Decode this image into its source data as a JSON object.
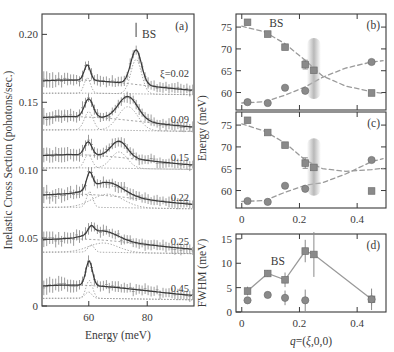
{
  "figure": {
    "background": "#ffffff",
    "ink_color": "#3a3a3a",
    "marker_color": "#8a8a8a",
    "line_color": "#9a9a9a",
    "band_color": "#b5b5b5"
  },
  "panel_a": {
    "label": "(a)",
    "xlabel": "Energy (meV)",
    "ylabel": "Inelastic Cross Section (pohotons/sec.)",
    "xticks": [
      60,
      80
    ],
    "xtick_labels": [
      "60",
      "80"
    ],
    "yticks": [
      0,
      0.05,
      0.1,
      0.15,
      0.2
    ],
    "ytick_labels": [
      "0",
      "0.05",
      "0.10",
      "0.15",
      "0.20"
    ],
    "xlim": [
      44,
      96
    ],
    "ylim": [
      0,
      0.215
    ],
    "bs_label": "BS",
    "curve_labels": [
      "ξ=0.02",
      "0.09",
      "0.15",
      "0.22",
      "0.25",
      "0.45"
    ],
    "curve_xi": [
      0.02,
      0.09,
      0.15,
      0.22,
      0.25,
      0.45
    ],
    "offsets": [
      0.155,
      0.128,
      0.1,
      0.071,
      0.038,
      0.004
    ],
    "peak1_center": [
      59.5,
      60.0,
      59.8,
      60.3,
      60.8,
      60.2
    ],
    "peak1_height": [
      0.0115,
      0.0135,
      0.0098,
      0.0118,
      0.0055,
      0.0135
    ],
    "peak1_fwhm": [
      2.5,
      3.5,
      3.0,
      2.4,
      2.4,
      2.6
    ],
    "peak2_center": [
      76.2,
      73.4,
      70.4,
      66.5,
      65.0,
      59.9
    ],
    "peak2_height": [
      0.0255,
      0.0175,
      0.012,
      0.0098,
      0.0068,
      0.0048
    ],
    "peak2_fwhm": [
      4.3,
      7.9,
      6.6,
      12.5,
      11.8,
      2.6
    ]
  },
  "panel_b": {
    "label": "(b)",
    "ylabel_shared": "Energy (meV)",
    "yticks": [
      60,
      65,
      70,
      75
    ],
    "ytick_labels": [
      "60",
      "65",
      "70",
      "75"
    ],
    "xticks": [
      0,
      0.2,
      0.4
    ],
    "ylim": [
      56,
      78
    ],
    "xlim": [
      -0.02,
      0.5
    ],
    "bs_label": "BS",
    "band_center_x": 0.25,
    "series": [
      {
        "name": "upper-branch-squares",
        "marker": "square",
        "x": [
          0.02,
          0.09,
          0.15,
          0.22,
          0.25,
          0.45
        ],
        "y": [
          76.1,
          73.4,
          70.4,
          66.4,
          65.1,
          59.9
        ],
        "yerr": [
          0.0,
          0.0,
          0.0,
          1.0,
          0.0,
          0.0
        ]
      },
      {
        "name": "lower-branch-circles",
        "marker": "circle",
        "x": [
          0.02,
          0.09,
          0.15,
          0.22,
          0.45
        ],
        "y": [
          57.8,
          57.6,
          61.1,
          60.4,
          67.0
        ],
        "yerr": [
          0.0,
          0.0,
          0.0,
          0.0,
          0.0
        ]
      }
    ],
    "dashed_curve_1": [
      [
        0.0,
        75.2
      ],
      [
        0.08,
        73.9
      ],
      [
        0.15,
        71.2
      ],
      [
        0.22,
        67.4
      ],
      [
        0.28,
        63.8
      ],
      [
        0.36,
        61.5
      ],
      [
        0.45,
        60.2
      ],
      [
        0.49,
        59.8
      ]
    ],
    "dashed_curve_2": [
      [
        0.0,
        57.6
      ],
      [
        0.08,
        57.9
      ],
      [
        0.15,
        59.4
      ],
      [
        0.22,
        61.3
      ],
      [
        0.28,
        63.5
      ],
      [
        0.36,
        65.6
      ],
      [
        0.45,
        67.0
      ],
      [
        0.49,
        67.3
      ]
    ]
  },
  "panel_c": {
    "label": "(c)",
    "yticks": [
      60,
      65,
      70,
      75
    ],
    "ytick_labels": [
      "60",
      "65",
      "70",
      "75"
    ],
    "xticks": [
      0,
      0.2,
      0.4
    ],
    "xtick_labels": [
      "0",
      "0.2",
      "0.4"
    ],
    "ylim": [
      56,
      78
    ],
    "xlim": [
      -0.02,
      0.5
    ],
    "band_center_x": 0.25,
    "series": [
      {
        "name": "upper-branch-squares",
        "marker": "square",
        "x": [
          0.02,
          0.09,
          0.15,
          0.22,
          0.25,
          0.45
        ],
        "y": [
          76.1,
          73.3,
          70.4,
          66.3,
          65.3,
          59.9
        ],
        "yerr": [
          0.0,
          0.0,
          0.0,
          1.2,
          0.0,
          0.0
        ]
      },
      {
        "name": "lower-branch-circles",
        "marker": "circle",
        "x": [
          0.02,
          0.09,
          0.15,
          0.22,
          0.45
        ],
        "y": [
          57.6,
          57.4,
          61.1,
          60.4,
          67.0
        ],
        "yerr": [
          0.0,
          0.0,
          0.0,
          0.0,
          0.0
        ]
      }
    ],
    "dashed_curve_1": [
      [
        0.0,
        75.3
      ],
      [
        0.08,
        73.6
      ],
      [
        0.15,
        70.9
      ],
      [
        0.22,
        67.0
      ],
      [
        0.28,
        65.0
      ],
      [
        0.36,
        64.4
      ],
      [
        0.45,
        64.8
      ],
      [
        0.49,
        65.1
      ]
    ],
    "dashed_curve_2": [
      [
        0.0,
        57.5
      ],
      [
        0.08,
        57.7
      ],
      [
        0.15,
        59.6
      ],
      [
        0.22,
        61.2
      ],
      [
        0.28,
        61.8
      ],
      [
        0.36,
        63.8
      ],
      [
        0.45,
        66.6
      ],
      [
        0.49,
        67.3
      ]
    ]
  },
  "panel_d": {
    "label": "(d)",
    "xlabel_parts": {
      "q": "q",
      "eq": "=(",
      "xi": "ξ",
      "rest": ",0,0)"
    },
    "xlabel": "q=(ξ,0,0)",
    "ylabel": "FWHM (meV)",
    "yticks": [
      0,
      5,
      10,
      15
    ],
    "ytick_labels": [
      "0",
      "5",
      "10",
      "15"
    ],
    "xticks": [
      0,
      0.2,
      0.4
    ],
    "xtick_labels": [
      "0",
      "0.2",
      "0.4"
    ],
    "ylim": [
      0,
      16
    ],
    "xlim": [
      -0.02,
      0.5
    ],
    "bs_label": "BS",
    "series": [
      {
        "name": "bs-squares-with-line",
        "marker": "square",
        "connected": true,
        "x": [
          0.02,
          0.09,
          0.15,
          0.22,
          0.25,
          0.45
        ],
        "y": [
          4.3,
          7.9,
          6.6,
          12.5,
          11.8,
          2.6
        ],
        "yerr": [
          0.9,
          0.7,
          1.5,
          2.3,
          4.6,
          2.2
        ]
      },
      {
        "name": "lower-circles",
        "marker": "circle",
        "connected": false,
        "x": [
          0.02,
          0.09,
          0.15,
          0.22,
          0.45
        ],
        "y": [
          2.4,
          3.5,
          2.9,
          2.4,
          2.6
        ],
        "yerr": [
          0.6,
          0.6,
          1.5,
          2.2,
          1.3
        ]
      }
    ]
  }
}
